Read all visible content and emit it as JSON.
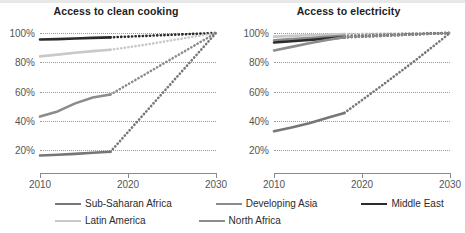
{
  "chart_data": [
    {
      "type": "line",
      "title": "Access to clean cooking",
      "xlabel": "",
      "ylabel": "",
      "xlim": [
        2010,
        2030
      ],
      "ylim": [
        10,
        102
      ],
      "xticks": [
        2010,
        2020,
        2030
      ],
      "xtick_labels": [
        "2010",
        "2020",
        "2030"
      ],
      "yticks": [
        20,
        40,
        60,
        80,
        100
      ],
      "ytick_labels": [
        "20%",
        "40%",
        "60%",
        "80%",
        "100%"
      ],
      "grid": true,
      "legend_position": "bottom",
      "historical_end_year": 2018,
      "series": [
        {
          "name": "Middle East",
          "color": "#2b2b2b",
          "x": [
            2010,
            2012,
            2014,
            2016,
            2018
          ],
          "values": [
            95.5,
            95.8,
            96.2,
            96.6,
            97.0
          ],
          "projection_x": [
            2018,
            2022,
            2026,
            2030
          ],
          "projection_values": [
            97.0,
            98.0,
            99.0,
            100.0
          ]
        },
        {
          "name": "Latin America",
          "color": "#c9c9c9",
          "x": [
            2010,
            2012,
            2014,
            2016,
            2018
          ],
          "values": [
            84.0,
            85.2,
            86.5,
            87.6,
            88.5
          ],
          "projection_x": [
            2018,
            2022,
            2026,
            2030
          ],
          "projection_values": [
            88.5,
            92.0,
            96.0,
            100.0
          ]
        },
        {
          "name": "Developing Asia",
          "color": "#8c8c8c",
          "x": [
            2010,
            2012,
            2014,
            2016,
            2018
          ],
          "values": [
            43.0,
            46.5,
            52.0,
            56.0,
            58.0
          ],
          "projection_x": [
            2018,
            2022,
            2026,
            2030
          ],
          "projection_values": [
            58.0,
            72.0,
            86.0,
            100.0
          ]
        },
        {
          "name": "Sub-Saharan Africa",
          "color": "#767676",
          "x": [
            2010,
            2012,
            2014,
            2016,
            2018
          ],
          "values": [
            16.5,
            17.0,
            17.6,
            18.3,
            19.0
          ],
          "projection_x": [
            2018,
            2022,
            2026,
            2030
          ],
          "projection_values": [
            19.0,
            46.0,
            73.0,
            100.0
          ]
        }
      ]
    },
    {
      "type": "line",
      "title": "Access to electricity",
      "xlabel": "",
      "ylabel": "",
      "xlim": [
        2010,
        2030
      ],
      "ylim": [
        10,
        102
      ],
      "xticks": [
        2010,
        2020,
        2030
      ],
      "xtick_labels": [
        "2010",
        "2020",
        "2030"
      ],
      "yticks": [
        20,
        40,
        60,
        80,
        100
      ],
      "ytick_labels": [
        "20%",
        "40%",
        "60%",
        "80%",
        "100%"
      ],
      "grid": true,
      "legend_position": "bottom",
      "historical_end_year": 2018,
      "series": [
        {
          "name": "Latin America",
          "color": "#c9c9c9",
          "x": [
            2010,
            2012,
            2014,
            2016,
            2018
          ],
          "values": [
            97.5,
            98.0,
            98.4,
            98.8,
            99.2
          ],
          "projection_x": [
            2018,
            2022,
            2026,
            2030
          ],
          "projection_values": [
            99.2,
            99.5,
            99.8,
            100.0
          ]
        },
        {
          "name": "Developing Asia",
          "color": "#8c8c8c",
          "x": [
            2010,
            2012,
            2014,
            2016,
            2018
          ],
          "values": [
            95.0,
            95.8,
            96.6,
            97.3,
            98.0
          ],
          "projection_x": [
            2018,
            2022,
            2026,
            2030
          ],
          "projection_values": [
            98.0,
            98.8,
            99.4,
            100.0
          ]
        },
        {
          "name": "Middle East",
          "color": "#2b2b2b",
          "x": [
            2010,
            2012,
            2014,
            2016,
            2018
          ],
          "values": [
            93.5,
            94.3,
            95.2,
            96.1,
            97.0
          ],
          "projection_x": [
            2018,
            2022,
            2026,
            2030
          ],
          "projection_values": [
            97.0,
            98.0,
            99.0,
            100.0
          ]
        },
        {
          "name": "North Africa",
          "color": "#8c8c8c",
          "x": [
            2010,
            2012,
            2014,
            2016,
            2018
          ],
          "values": [
            88.0,
            90.5,
            93.0,
            95.2,
            97.0
          ],
          "projection_x": [
            2018,
            2022,
            2026,
            2030
          ],
          "projection_values": [
            97.0,
            98.0,
            99.0,
            100.0
          ]
        },
        {
          "name": "Sub-Saharan Africa",
          "color": "#767676",
          "x": [
            2010,
            2012,
            2014,
            2016,
            2018
          ],
          "values": [
            33.0,
            35.5,
            38.5,
            42.0,
            45.5
          ],
          "projection_x": [
            2018,
            2022,
            2026,
            2030
          ],
          "projection_values": [
            45.5,
            63.0,
            81.0,
            100.0
          ]
        }
      ]
    }
  ],
  "legend": {
    "items": [
      {
        "label": "Sub-Saharan Africa",
        "color": "#767676"
      },
      {
        "label": "Developing Asia",
        "color": "#8c8c8c"
      },
      {
        "label": "Middle East",
        "color": "#2b2b2b"
      },
      {
        "label": "Latin America",
        "color": "#c9c9c9"
      },
      {
        "label": "North Africa",
        "color": "#8c8c8c"
      }
    ]
  }
}
